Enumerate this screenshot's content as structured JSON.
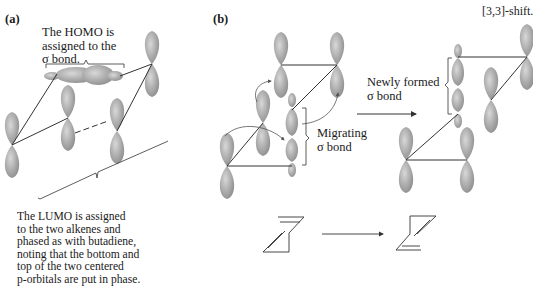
{
  "panel_a": {
    "label": "(a)",
    "homo_caption": [
      "The HOMO is",
      "assigned to the",
      "σ bond."
    ],
    "lumo_caption": [
      "The LUMO is assigned",
      "to the two alkenes and",
      "phased as with butadiene,",
      "noting that the bottom and",
      "top of the two centered",
      "p-orbitals are put in phase."
    ]
  },
  "panel_b": {
    "label": "(b)",
    "title": "[3,3]-shift.",
    "migrating_caption": [
      "Migrating",
      "σ bond"
    ],
    "newly_formed_caption": [
      "Newly formed",
      "σ bond"
    ]
  },
  "colors": {
    "orbital_fill": "#9a9a9a",
    "orbital_light": "#d6d6d6",
    "line": "#333333"
  }
}
